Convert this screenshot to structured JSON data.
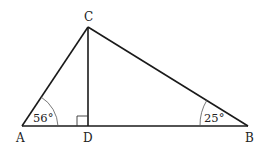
{
  "diagram": {
    "points": {
      "A": {
        "label": "A",
        "x": 22,
        "y": 126
      },
      "B": {
        "label": "B",
        "x": 248,
        "y": 126
      },
      "C": {
        "label": "C",
        "x": 88,
        "y": 27
      },
      "D": {
        "label": "D",
        "x": 88,
        "y": 126
      }
    },
    "angles": {
      "A": {
        "label": "56°"
      },
      "B": {
        "label": "25°"
      }
    },
    "right_angle_at": "D",
    "line_color": "#1a1a1a"
  }
}
